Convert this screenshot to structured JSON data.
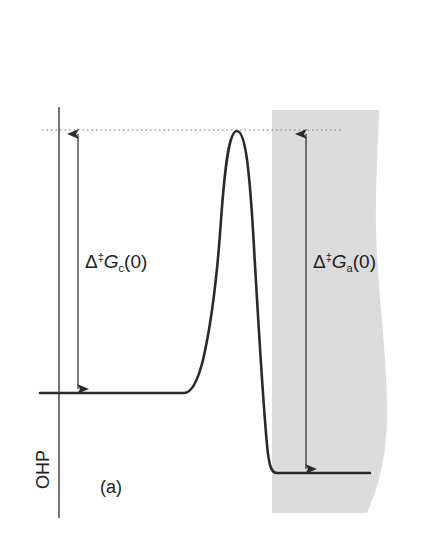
{
  "figure": {
    "panel_label": "(a)",
    "plane_label": "OHP",
    "barrier_labels": {
      "cathodic": {
        "delta": "Δ",
        "dagger": "‡",
        "symbol": "G",
        "subscript": "c",
        "arg": "(0)"
      },
      "anodic": {
        "delta": "Δ",
        "dagger": "‡",
        "symbol": "G",
        "subscript": "a",
        "arg": "(0)"
      }
    },
    "colors": {
      "line": "#2a2a2a",
      "dotted": "#777777",
      "electrode_shading": "#dcdcdc",
      "text": "#222222"
    }
  }
}
